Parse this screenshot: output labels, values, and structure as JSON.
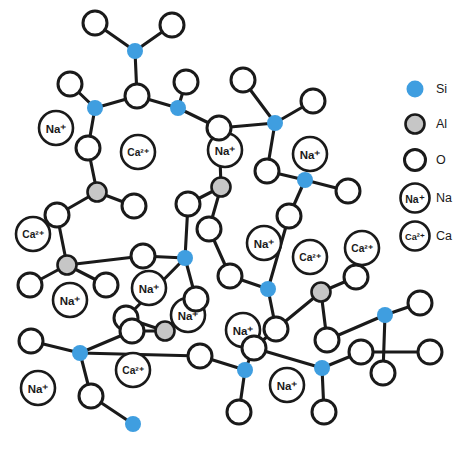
{
  "figure": {
    "background_color": "#ffffff"
  },
  "colors": {
    "silicon": "#3f9ee0",
    "aluminium": "#c6c6c6",
    "oxygen": "#ffffff",
    "outline": "#1a1a1a",
    "bond": "#1a1a1a"
  },
  "legend": {
    "position": "right",
    "items": [
      {
        "key": "si",
        "symbol_type": "filled-circle",
        "color": "#3f9ee0",
        "label": "Si",
        "cx": 415,
        "cy": 89,
        "r": 8.5,
        "text_x": 436,
        "text_y": 89
      },
      {
        "key": "al",
        "symbol_type": "filled-circle",
        "color": "#c6c6c6",
        "label": "Al",
        "cx": 415,
        "cy": 124,
        "r": 9.5,
        "text_x": 436,
        "text_y": 124
      },
      {
        "key": "o",
        "symbol_type": "open-circle",
        "color": "#ffffff",
        "label": "O",
        "cx": 415,
        "cy": 160,
        "r": 10.5,
        "text_x": 436,
        "text_y": 160
      },
      {
        "key": "na",
        "symbol_type": "ion-circle",
        "color": "#ffffff",
        "label": "Na",
        "ion_label": "Na⁺",
        "cx": 415,
        "cy": 198,
        "r": 14.5,
        "text_x": 436,
        "text_y": 198
      },
      {
        "key": "ca",
        "symbol_type": "ion-circle",
        "color": "#ffffff",
        "label": "Ca",
        "ion_label": "Ca²⁺",
        "cx": 415,
        "cy": 236,
        "r": 14.5,
        "text_x": 436,
        "text_y": 236
      }
    ]
  },
  "chart_data": {
    "type": "diagram",
    "species": [
      {
        "id": "si",
        "name": "Silicon",
        "symbol": "Si",
        "render": "filled-circle",
        "color": "#3f9ee0",
        "radius": 8.0,
        "count": 17
      },
      {
        "id": "al",
        "name": "Aluminium",
        "symbol": "Al",
        "render": "filled-circle",
        "color": "#c6c6c6",
        "radius": 9.5,
        "count": 7
      },
      {
        "id": "o",
        "name": "Oxygen",
        "symbol": "O",
        "render": "open-circle",
        "color": "#ffffff",
        "radius": 12.0,
        "count": 48
      },
      {
        "id": "na",
        "name": "Sodium ion",
        "symbol": "Na⁺",
        "render": "ion-circle",
        "color": "#ffffff",
        "radius": 17.0,
        "count": 10
      },
      {
        "id": "ca",
        "name": "Calcium ion",
        "symbol": "Ca²⁺",
        "render": "ion-circle",
        "color": "#ffffff",
        "radius": 17.0,
        "count": 5
      }
    ],
    "atoms": [
      {
        "id": "o1",
        "species": "o",
        "x": 95,
        "y": 23
      },
      {
        "id": "o2",
        "species": "o",
        "x": 172,
        "y": 25
      },
      {
        "id": "si1",
        "species": "si",
        "x": 135,
        "y": 51
      },
      {
        "id": "o3",
        "species": "o",
        "x": 70,
        "y": 84
      },
      {
        "id": "o4",
        "species": "o",
        "x": 137,
        "y": 96
      },
      {
        "id": "si2",
        "species": "si",
        "x": 95,
        "y": 108
      },
      {
        "id": "si3",
        "species": "si",
        "x": 178,
        "y": 108
      },
      {
        "id": "o5",
        "species": "o",
        "x": 186,
        "y": 82
      },
      {
        "id": "o6",
        "species": "o",
        "x": 243,
        "y": 80
      },
      {
        "id": "si4",
        "species": "si",
        "x": 275,
        "y": 123
      },
      {
        "id": "o7",
        "species": "o",
        "x": 313,
        "y": 101
      },
      {
        "id": "o8",
        "species": "o",
        "x": 219,
        "y": 128
      },
      {
        "id": "o9",
        "species": "o",
        "x": 88,
        "y": 148
      },
      {
        "id": "al1",
        "species": "al",
        "x": 97,
        "y": 192
      },
      {
        "id": "o10",
        "species": "o",
        "x": 134,
        "y": 206
      },
      {
        "id": "o11",
        "species": "o",
        "x": 57,
        "y": 215
      },
      {
        "id": "al2",
        "species": "al",
        "x": 221,
        "y": 187
      },
      {
        "id": "o12",
        "species": "o",
        "x": 188,
        "y": 204
      },
      {
        "id": "o13",
        "species": "o",
        "x": 267,
        "y": 171
      },
      {
        "id": "si5",
        "species": "si",
        "x": 305,
        "y": 180
      },
      {
        "id": "o14",
        "species": "o",
        "x": 348,
        "y": 191
      },
      {
        "id": "o15",
        "species": "o",
        "x": 289,
        "y": 216
      },
      {
        "id": "o16",
        "species": "o",
        "x": 209,
        "y": 229
      },
      {
        "id": "al3",
        "species": "al",
        "x": 67,
        "y": 265
      },
      {
        "id": "o17",
        "species": "o",
        "x": 30,
        "y": 285
      },
      {
        "id": "o18",
        "species": "o",
        "x": 106,
        "y": 285
      },
      {
        "id": "si6",
        "species": "si",
        "x": 185,
        "y": 258
      },
      {
        "id": "o19",
        "species": "o",
        "x": 143,
        "y": 256
      },
      {
        "id": "o20",
        "species": "o",
        "x": 196,
        "y": 299
      },
      {
        "id": "al4",
        "species": "al",
        "x": 165,
        "y": 331
      },
      {
        "id": "o21",
        "species": "o",
        "x": 126,
        "y": 318
      },
      {
        "id": "si7",
        "species": "si",
        "x": 268,
        "y": 289
      },
      {
        "id": "o22",
        "species": "o",
        "x": 230,
        "y": 276
      },
      {
        "id": "o23",
        "species": "o",
        "x": 276,
        "y": 329
      },
      {
        "id": "al5",
        "species": "al",
        "x": 321,
        "y": 292
      },
      {
        "id": "o24",
        "species": "o",
        "x": 356,
        "y": 277
      },
      {
        "id": "o25",
        "species": "o",
        "x": 327,
        "y": 340
      },
      {
        "id": "si8",
        "species": "si",
        "x": 385,
        "y": 315
      },
      {
        "id": "o26",
        "species": "o",
        "x": 420,
        "y": 303
      },
      {
        "id": "o27",
        "species": "o",
        "x": 254,
        "y": 348
      },
      {
        "id": "si9",
        "species": "si",
        "x": 322,
        "y": 368
      },
      {
        "id": "o28",
        "species": "o",
        "x": 361,
        "y": 352
      },
      {
        "id": "si10",
        "species": "si",
        "x": 245,
        "y": 370
      },
      {
        "id": "o29",
        "species": "o",
        "x": 200,
        "y": 356
      },
      {
        "id": "o30",
        "species": "o",
        "x": 239,
        "y": 412
      },
      {
        "id": "o31",
        "species": "o",
        "x": 324,
        "y": 412
      },
      {
        "id": "si11",
        "species": "si",
        "x": 80,
        "y": 353
      },
      {
        "id": "o32",
        "species": "o",
        "x": 31,
        "y": 341
      },
      {
        "id": "o33",
        "species": "o",
        "x": 91,
        "y": 396
      },
      {
        "id": "si12",
        "species": "si",
        "x": 133,
        "y": 424
      },
      {
        "id": "o34",
        "species": "o",
        "x": 132,
        "y": 331
      },
      {
        "id": "o35",
        "species": "o",
        "x": 383,
        "y": 373
      },
      {
        "id": "o36",
        "species": "o",
        "x": 430,
        "y": 352
      }
    ],
    "modifier_ions": [
      {
        "id": "na1",
        "species": "na",
        "symbol": "Na⁺",
        "x": 56,
        "y": 128
      },
      {
        "id": "ca1",
        "species": "ca",
        "symbol": "Ca²⁺",
        "x": 138,
        "y": 152
      },
      {
        "id": "na2",
        "species": "na",
        "symbol": "Na⁺",
        "x": 225,
        "y": 150
      },
      {
        "id": "na3",
        "species": "na",
        "symbol": "Na⁺",
        "x": 310,
        "y": 154
      },
      {
        "id": "ca2",
        "species": "ca",
        "symbol": "Ca²⁺",
        "x": 33,
        "y": 234
      },
      {
        "id": "na4",
        "species": "na",
        "symbol": "Na⁺",
        "x": 149,
        "y": 288
      },
      {
        "id": "na5",
        "species": "na",
        "symbol": "Na⁺",
        "x": 264,
        "y": 243
      },
      {
        "id": "ca3",
        "species": "ca",
        "symbol": "Ca²⁺",
        "x": 362,
        "y": 248
      },
      {
        "id": "ca4",
        "species": "ca",
        "symbol": "Ca²⁺",
        "x": 133,
        "y": 370
      },
      {
        "id": "na6",
        "species": "na",
        "symbol": "Na⁺",
        "x": 38,
        "y": 388
      },
      {
        "id": "na7",
        "species": "na",
        "symbol": "Na⁺",
        "x": 188,
        "y": 315
      },
      {
        "id": "na8",
        "species": "na",
        "symbol": "Na⁺",
        "x": 287,
        "y": 385
      },
      {
        "id": "na9",
        "species": "na",
        "symbol": "Na⁺",
        "x": 243,
        "y": 330
      },
      {
        "id": "ca5",
        "species": "ca",
        "symbol": "Ca²⁺",
        "x": 310,
        "y": 257
      },
      {
        "id": "na10",
        "species": "na",
        "symbol": "Na⁺",
        "x": 70,
        "y": 300
      }
    ],
    "bonds": [
      [
        "o1",
        "si1"
      ],
      [
        "o2",
        "si1"
      ],
      [
        "si1",
        "o4"
      ],
      [
        "o3",
        "si2"
      ],
      [
        "si2",
        "o4"
      ],
      [
        "si2",
        "o9"
      ],
      [
        "o4",
        "si3"
      ],
      [
        "si3",
        "o5"
      ],
      [
        "si3",
        "o8"
      ],
      [
        "o6",
        "si4"
      ],
      [
        "si4",
        "o7"
      ],
      [
        "si4",
        "o8"
      ],
      [
        "si4",
        "o13"
      ],
      [
        "o8",
        "al2"
      ],
      [
        "o9",
        "al1"
      ],
      [
        "al1",
        "o10"
      ],
      [
        "al1",
        "o11"
      ],
      [
        "al2",
        "o12"
      ],
      [
        "al2",
        "o16"
      ],
      [
        "o13",
        "si5"
      ],
      [
        "si5",
        "o14"
      ],
      [
        "si5",
        "o15"
      ],
      [
        "o11",
        "al3"
      ],
      [
        "al3",
        "o17"
      ],
      [
        "al3",
        "o18"
      ],
      [
        "o12",
        "si6"
      ],
      [
        "si6",
        "o19"
      ],
      [
        "si6",
        "o20"
      ],
      [
        "o20",
        "al4"
      ],
      [
        "al4",
        "o21"
      ],
      [
        "al4",
        "o34"
      ],
      [
        "o15",
        "si7"
      ],
      [
        "si7",
        "o22"
      ],
      [
        "si7",
        "o23"
      ],
      [
        "o23",
        "al5"
      ],
      [
        "al5",
        "o24"
      ],
      [
        "al5",
        "o25"
      ],
      [
        "o25",
        "si8"
      ],
      [
        "si8",
        "o26"
      ],
      [
        "si8",
        "o35"
      ],
      [
        "o16",
        "o22"
      ],
      [
        "o27",
        "si9"
      ],
      [
        "si9",
        "o28"
      ],
      [
        "si9",
        "o31"
      ],
      [
        "o27",
        "si10"
      ],
      [
        "si10",
        "o29"
      ],
      [
        "si10",
        "o30"
      ],
      [
        "o29",
        "si11"
      ],
      [
        "si11",
        "o32"
      ],
      [
        "si11",
        "o33"
      ],
      [
        "o33",
        "si12"
      ],
      [
        "o34",
        "si11"
      ],
      [
        "o19",
        "al3"
      ],
      [
        "o28",
        "o36"
      ],
      [
        "o23",
        "o27"
      ],
      [
        "o21",
        "si6"
      ]
    ],
    "layout": {
      "width": 473,
      "height": 450
    }
  }
}
